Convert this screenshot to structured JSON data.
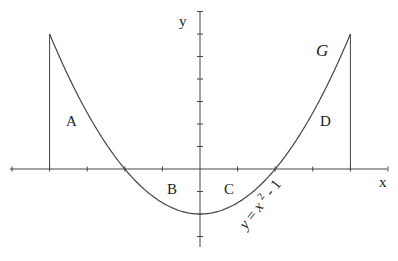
{
  "figure": {
    "title": "",
    "curve_name": "G",
    "equation_label": "y = x² - 1",
    "equation_parts": {
      "y": "y",
      "eq": "=",
      "x": "x",
      "exp": "2",
      "rest": "- 1"
    },
    "axis_labels": {
      "x": "x",
      "y": "y"
    },
    "region_labels": [
      "A",
      "B",
      "C",
      "D"
    ],
    "colors": {
      "line": "#444444",
      "text": "#222222",
      "background": "#ffffff"
    }
  },
  "chart_data": {
    "type": "line",
    "title": "",
    "xlabel": "x",
    "ylabel": "y",
    "function": "y = x^2 - 1",
    "curve_label": "G",
    "domain": [
      -2,
      2
    ],
    "x": [
      -2,
      -1.5,
      -1,
      -0.5,
      0,
      0.5,
      1,
      1.5,
      2
    ],
    "y": [
      3,
      1.25,
      0,
      -0.75,
      -1,
      -0.75,
      0,
      1.25,
      3
    ],
    "x_ticks_step": 0.5,
    "y_ticks_step": 0.5,
    "xlim": [
      -2.5,
      2.5
    ],
    "ylim": [
      -1.75,
      3.5
    ],
    "vertical_lines_at": [
      -2,
      2
    ],
    "regions": [
      {
        "label": "A",
        "interval": [
          -2,
          -1
        ],
        "position": "above x-axis"
      },
      {
        "label": "B",
        "interval": [
          -1,
          0
        ],
        "position": "below x-axis"
      },
      {
        "label": "C",
        "interval": [
          0,
          1
        ],
        "position": "below x-axis"
      },
      {
        "label": "D",
        "interval": [
          1,
          2
        ],
        "position": "above x-axis"
      }
    ],
    "grid": false
  }
}
